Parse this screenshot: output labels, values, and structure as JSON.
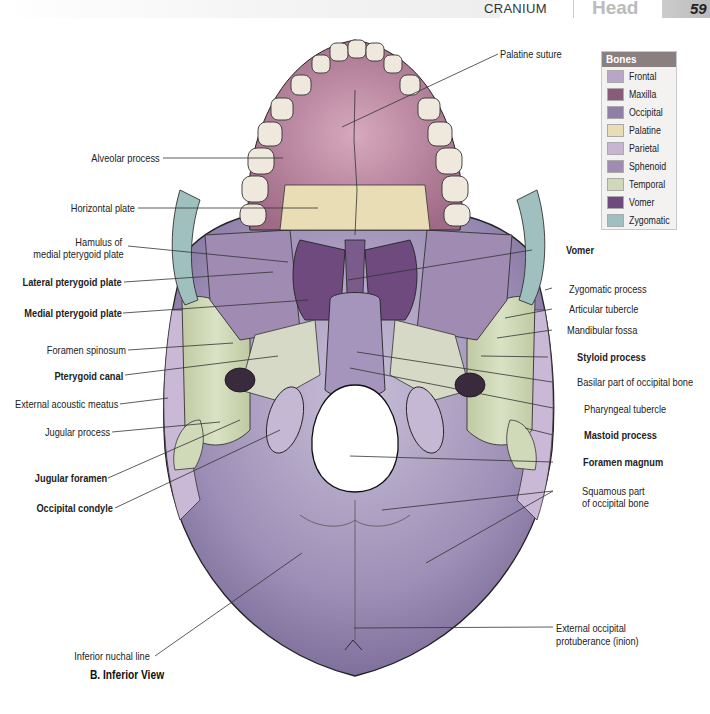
{
  "header": {
    "section": "CRANIUM",
    "chapter": "Head",
    "page_number": "59"
  },
  "legend": {
    "title": "Bones",
    "items": [
      {
        "label": "Frontal",
        "color": "#b9a5c7"
      },
      {
        "label": "Maxilla",
        "color": "#8a5a78"
      },
      {
        "label": "Occipital",
        "color": "#8f7fa6"
      },
      {
        "label": "Palatine",
        "color": "#e9ddb5"
      },
      {
        "label": "Parietal",
        "color": "#c7b5d2"
      },
      {
        "label": "Sphenoid",
        "color": "#a08bb3"
      },
      {
        "label": "Temporal",
        "color": "#cfd9b8"
      },
      {
        "label": "Vomer",
        "color": "#6f4a7e"
      },
      {
        "label": "Zygomatic",
        "color": "#9fc0bf"
      }
    ]
  },
  "labels": {
    "left": [
      {
        "text": "Alveolar process",
        "bold": false
      },
      {
        "text": "Horizontal plate",
        "bold": false
      },
      {
        "text": "Hamulus of",
        "bold": false
      },
      {
        "text": "medial pterygoid plate",
        "bold": false
      },
      {
        "text": "Lateral pterygoid plate",
        "bold": true
      },
      {
        "text": "Medial pterygoid plate",
        "bold": true
      },
      {
        "text": "Foramen spinosum",
        "bold": false
      },
      {
        "text": "Pterygoid canal",
        "bold": true
      },
      {
        "text": "External acoustic meatus",
        "bold": false
      },
      {
        "text": "Jugular process",
        "bold": false
      },
      {
        "text": "Jugular foramen",
        "bold": true
      },
      {
        "text": "Occipital condyle",
        "bold": true
      },
      {
        "text": "Inferior nuchal line",
        "bold": false
      }
    ],
    "right": [
      {
        "text": "Palatine suture",
        "bold": false
      },
      {
        "text": "Vomer",
        "bold": true
      },
      {
        "text": "Zygomatic process",
        "bold": false
      },
      {
        "text": "Articular tubercle",
        "bold": false
      },
      {
        "text": "Mandibular fossa",
        "bold": false
      },
      {
        "text": "Styloid process",
        "bold": true
      },
      {
        "text": "Basilar part of occipital bone",
        "bold": false
      },
      {
        "text": "Pharyngeal tubercle",
        "bold": false
      },
      {
        "text": "Mastoid process",
        "bold": true
      },
      {
        "text": "Foramen magnum",
        "bold": true
      },
      {
        "text": "Squamous part",
        "bold": false
      },
      {
        "text": "of occipital bone",
        "bold": false
      },
      {
        "text": "External occipital",
        "bold": false
      },
      {
        "text": "protuberance (inion)",
        "bold": false
      }
    ]
  },
  "caption": "B. Inferior View"
}
